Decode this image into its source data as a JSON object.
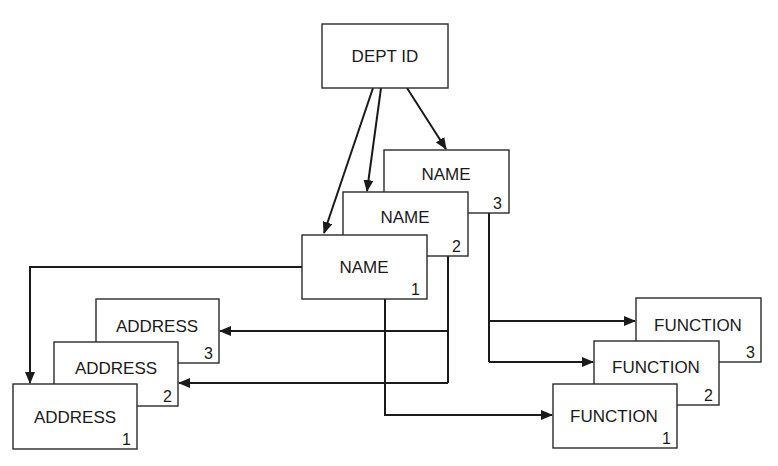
{
  "diagram": {
    "root": {
      "label": "DEPT ID"
    },
    "names": [
      {
        "label": "NAME",
        "index": "1"
      },
      {
        "label": "NAME",
        "index": "2"
      },
      {
        "label": "NAME",
        "index": "3"
      }
    ],
    "addresses": [
      {
        "label": "ADDRESS",
        "index": "1"
      },
      {
        "label": "ADDRESS",
        "index": "2"
      },
      {
        "label": "ADDRESS",
        "index": "3"
      }
    ],
    "functions": [
      {
        "label": "FUNCTION",
        "index": "1"
      },
      {
        "label": "FUNCTION",
        "index": "2"
      },
      {
        "label": "FUNCTION",
        "index": "3"
      }
    ],
    "edges": [
      {
        "from": "DEPT ID",
        "to": "NAME 1"
      },
      {
        "from": "DEPT ID",
        "to": "NAME 2"
      },
      {
        "from": "DEPT ID",
        "to": "NAME 3"
      },
      {
        "from": "NAME 1",
        "to": "ADDRESS 1"
      },
      {
        "from": "NAME 1",
        "to": "FUNCTION 1"
      },
      {
        "from": "NAME 2",
        "to": "ADDRESS 2"
      },
      {
        "from": "NAME 2",
        "to": "ADDRESS 3"
      },
      {
        "from": "NAME 3",
        "to": "FUNCTION 2"
      },
      {
        "from": "NAME 3",
        "to": "FUNCTION 3"
      }
    ],
    "colors": {
      "stroke": "#1a1a1a",
      "background": "#ffffff"
    }
  }
}
